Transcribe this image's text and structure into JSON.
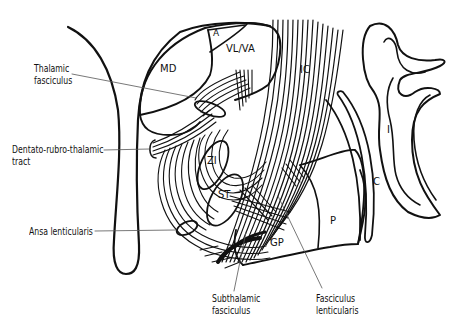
{
  "diagram": {
    "type": "anatomical-line-drawing",
    "region_labels": {
      "md": "MD",
      "a": "A",
      "vl_va": "VL/VA",
      "ic": "IC",
      "i": "I",
      "c": "C",
      "zi": "ZI",
      "st": "ST",
      "p": "P",
      "gp": "GP"
    },
    "callouts": {
      "thalamic_fasciculus": [
        "Thalamic",
        "fasciculus"
      ],
      "dentato_rubro_thalamic": [
        "Dentato-rubro-thalamic",
        "tract"
      ],
      "ansa_lenticularis": [
        "Ansa lenticularis"
      ],
      "subthalamic_fasciculus": [
        "Subthalamic",
        "fasciculus"
      ],
      "fasciculus_lenticularis": [
        "Fasciculus",
        "lenticularis"
      ]
    },
    "colors": {
      "stroke": "#111111",
      "leader": "#555555",
      "background": "#ffffff"
    }
  }
}
